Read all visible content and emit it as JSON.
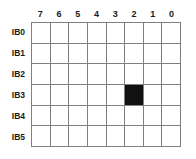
{
  "figure": {
    "name": "bit-matrix-grid",
    "background_color": "#ffffff",
    "grid_line_color": "#808080",
    "filled_cell_color": "#111111",
    "label_color": "#1a1a1a"
  },
  "column_headers": [
    "7",
    "6",
    "5",
    "4",
    "3",
    "2",
    "1",
    "0"
  ],
  "row_labels": [
    "IB0",
    "IB1",
    "IB2",
    "IB3",
    "IB4",
    "IB5"
  ],
  "cells": [
    [
      0,
      0,
      0,
      0,
      0,
      0,
      0,
      0
    ],
    [
      0,
      0,
      0,
      0,
      0,
      0,
      0,
      0
    ],
    [
      0,
      0,
      0,
      0,
      0,
      0,
      0,
      0
    ],
    [
      0,
      0,
      0,
      0,
      0,
      1,
      0,
      0
    ],
    [
      0,
      0,
      0,
      0,
      0,
      0,
      0,
      0
    ],
    [
      0,
      0,
      0,
      0,
      0,
      0,
      0,
      0
    ]
  ],
  "filled_cells": [
    {
      "row_label": "IB3",
      "column_header": "2"
    }
  ]
}
